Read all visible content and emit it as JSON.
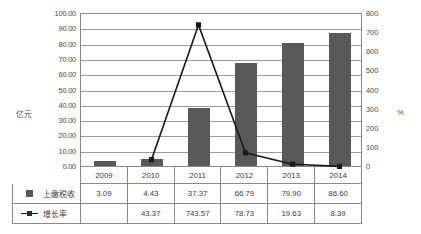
{
  "chart_data": {
    "type": "bar",
    "title": "",
    "categories": [
      "2009",
      "2010",
      "2011",
      "2012",
      "2013",
      "2014"
    ],
    "series": [
      {
        "name": "上缴税收",
        "type": "bar",
        "axis": "left",
        "values": [
          3.09,
          4.43,
          37.37,
          66.79,
          79.9,
          86.6
        ],
        "labels": [
          "3.09",
          "4.43",
          "37.37",
          "66.79",
          "79.90",
          "86.60"
        ],
        "color": "#595959"
      },
      {
        "name": "增长率",
        "type": "line",
        "axis": "right",
        "values": [
          null,
          43.37,
          743.57,
          78.73,
          19.63,
          8.39
        ],
        "labels": [
          "",
          "43.37",
          "743.57",
          "78.73",
          "19.63",
          "8.39"
        ],
        "color": "#1a1a1a"
      }
    ],
    "xlabel": "",
    "ylabel": "亿元",
    "y2label": "%",
    "ylim": [
      0,
      100
    ],
    "y2lim": [
      0,
      800
    ],
    "yticks": [
      0,
      10,
      20,
      30,
      40,
      50,
      60,
      70,
      80,
      90,
      100
    ],
    "ytick_labels": [
      "0.00",
      "10.00",
      "20.00",
      "30.00",
      "40.00",
      "50.00",
      "60.00",
      "70.00",
      "80.00",
      "90.00",
      "100.00"
    ],
    "y2ticks": [
      0,
      100,
      200,
      300,
      400,
      500,
      600,
      700,
      800
    ],
    "y2tick_labels": [
      "0",
      "100",
      "200",
      "300",
      "400",
      "500",
      "600",
      "700",
      "800"
    ],
    "grid": true,
    "legend_position": "data-table"
  },
  "axes": {
    "left_title": "亿元",
    "right_title": "%",
    "left_ticks": [
      "100.00",
      "90.00",
      "80.00",
      "70.00",
      "60.00",
      "50.00",
      "40.00",
      "30.00",
      "20.00",
      "10.00",
      "0.00"
    ],
    "right_ticks": [
      "800",
      "700",
      "600",
      "500",
      "400",
      "300",
      "200",
      "100",
      "0"
    ]
  },
  "table": {
    "categories": [
      "2009",
      "2010",
      "2011",
      "2012",
      "2013",
      "2014"
    ],
    "rows": [
      {
        "marker": "bar-swatch-icon",
        "label": "上缴税收",
        "values": [
          "3.09",
          "4.43",
          "37.37",
          "66.79",
          "79.90",
          "86.60"
        ]
      },
      {
        "marker": "line-marker-icon",
        "label": "增长率",
        "values": [
          "",
          "43.37",
          "743.57",
          "78.73",
          "19.63",
          "8.39"
        ]
      }
    ]
  },
  "colors": {
    "bar": "#595959",
    "line": "#1a1a1a",
    "grid": "#9c9c9c",
    "border": "#8a8a8a",
    "text": "#3a3a3a"
  }
}
